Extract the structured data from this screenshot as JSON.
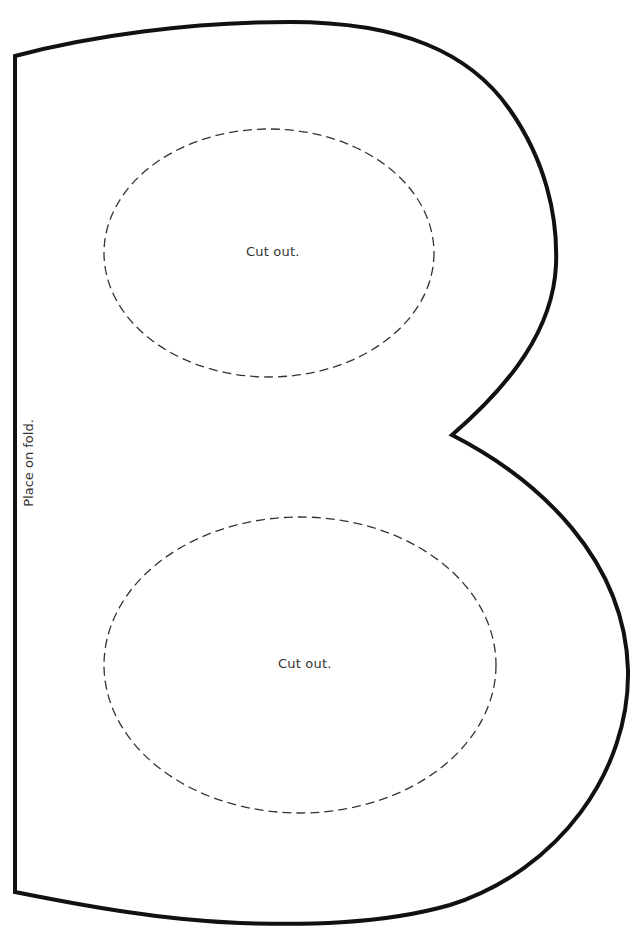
{
  "template": {
    "letter": "B",
    "outline_color": "#111111",
    "cut_line_color": "#333333",
    "background": "#ffffff"
  },
  "labels": {
    "upper_cutout": "Cut out.",
    "lower_cutout": "Cut out.",
    "fold": "Place on fold."
  }
}
